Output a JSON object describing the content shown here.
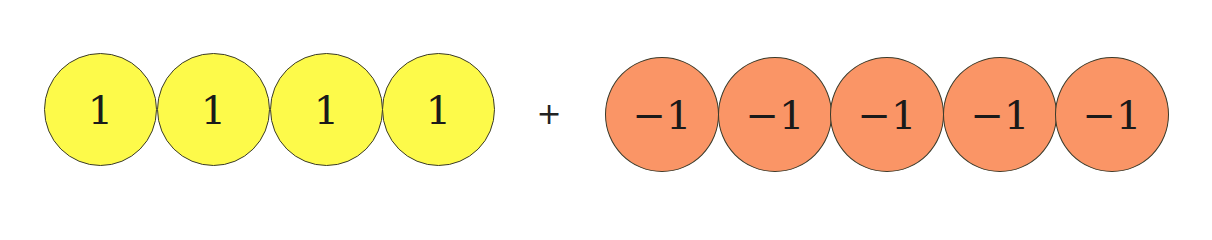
{
  "diagram": {
    "colors": {
      "positive": "#fdfa4a",
      "negative": "#fa9566",
      "outline": "#3a3a2a"
    },
    "positive_group": {
      "counters": [
        {
          "label": "1"
        },
        {
          "label": "1"
        },
        {
          "label": "1"
        },
        {
          "label": "1"
        }
      ]
    },
    "operator": "+",
    "negative_group": {
      "counters": [
        {
          "label": "−1"
        },
        {
          "label": "−1"
        },
        {
          "label": "−1"
        },
        {
          "label": "−1"
        },
        {
          "label": "−1"
        }
      ]
    }
  }
}
